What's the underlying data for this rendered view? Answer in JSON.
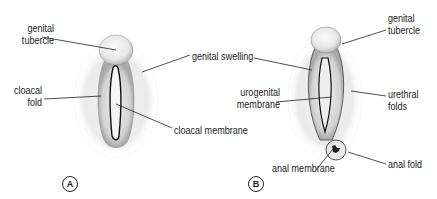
{
  "figure_a": {
    "badge": "A",
    "labels": {
      "genital_tubercle": [
        "genital",
        "tubercle"
      ],
      "genital_swelling": "genital swelling",
      "cloacal_fold": [
        "cloacal",
        "fold"
      ],
      "cloacal_membrane": "cloacal membrane"
    }
  },
  "figure_b": {
    "badge": "B",
    "labels": {
      "genital_tubercle": [
        "genital",
        "tubercle"
      ],
      "urogenital_membrane": [
        "urogenital",
        "membrane"
      ],
      "urethral_folds": [
        "urethral",
        "folds"
      ],
      "anal_membrane": "anal membrane",
      "anal_fold": "anal fold"
    }
  },
  "colors": {
    "ink": "#222222",
    "stipple": "#c8c8c8",
    "background": "#ffffff"
  }
}
